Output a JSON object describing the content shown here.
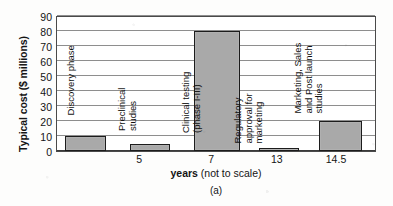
{
  "chart_data": {
    "type": "bar",
    "title": "",
    "caption": "(a)",
    "ylabel": "Typical cost ($ millions)",
    "xlabel_bold": "years",
    "xlabel_rest": " (not to scale)",
    "ylim": [
      0,
      90
    ],
    "ytick_values": [
      90,
      80,
      70,
      60,
      50,
      40,
      30,
      20,
      10,
      0
    ],
    "ytick_labels": [
      "90",
      "80",
      "70",
      "60",
      "50",
      "40",
      "30",
      "20",
      "10",
      "0"
    ],
    "xtick_labels": [
      "5",
      "7",
      "13",
      "14.5"
    ],
    "xtick_positions_pct": [
      26.0,
      48.5,
      69.0,
      87.5
    ],
    "grid": "horizontal",
    "legend": "none",
    "bar_fill": "#a9a9a9",
    "bar_edge": "#1c1c1c",
    "categories": [
      "Discovery phase",
      "Preclinical studies",
      "Clinical testing (phase I-III)",
      "Regulatory approval for marketing",
      "Marketing, Sales and Post launch studies"
    ],
    "values": [
      10,
      5,
      80,
      1,
      20
    ],
    "bars": [
      {
        "name": "Discovery phase",
        "value": 10,
        "label_lines": [
          "Discovery phase"
        ],
        "left_pct": 2.5,
        "width_pct": 13.0,
        "label_left_pct": 6.0,
        "label_bottom_px": 36
      },
      {
        "name": "Preclinical studies",
        "value": 5,
        "label_lines": [
          "Preclinical",
          "studies"
        ],
        "left_pct": 23.0,
        "width_pct": 12.5,
        "label_left_pct": 25.5,
        "label_bottom_px": 20
      },
      {
        "name": "Clinical testing (phase I-III)",
        "value": 80,
        "label_lines": [
          "Clinical testing",
          "(phase I-III)"
        ],
        "left_pct": 43.0,
        "width_pct": 14.5,
        "label_left_pct": 45.5,
        "label_bottom_px": 18
      },
      {
        "name": "Regulatory approval for marketing",
        "value": 1,
        "label_lines": [
          "Regulatory",
          "approval for",
          "marketing"
        ],
        "left_pct": 63.5,
        "width_pct": 12.5,
        "label_left_pct": 65.0,
        "label_bottom_px": 8
      },
      {
        "name": "Marketing, Sales and Post launch studies",
        "value": 20,
        "label_lines": [
          "Marketing, Sales",
          "and Post launch",
          "studies"
        ],
        "left_pct": 82.5,
        "width_pct": 13.5,
        "label_left_pct": 84.0,
        "label_bottom_px": 38
      }
    ]
  }
}
